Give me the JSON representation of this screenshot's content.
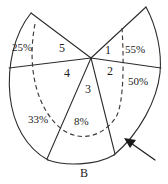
{
  "figure": {
    "caption": "B",
    "stroke_color": "#2b2b2b",
    "dashed_color": "#3a3a3a",
    "background": "#ffffff",
    "percent_labels": [
      {
        "text": "25%",
        "x": 12,
        "y": 42
      },
      {
        "text": "55%",
        "x": 125,
        "y": 44
      },
      {
        "text": "50%",
        "x": 128,
        "y": 76
      },
      {
        "text": "33%",
        "x": 28,
        "y": 114
      },
      {
        "text": "8%",
        "x": 74,
        "y": 116
      }
    ],
    "region_labels": [
      {
        "text": "1",
        "x": 105,
        "y": 44
      },
      {
        "text": "2",
        "x": 107,
        "y": 65
      },
      {
        "text": "3",
        "x": 85,
        "y": 83
      },
      {
        "text": "4",
        "x": 64,
        "y": 67
      },
      {
        "text": "5",
        "x": 59,
        "y": 42
      }
    ],
    "annotation": {
      "arrow_name": "pointer-arrow",
      "target_description": "lower-right boundary curve"
    }
  }
}
